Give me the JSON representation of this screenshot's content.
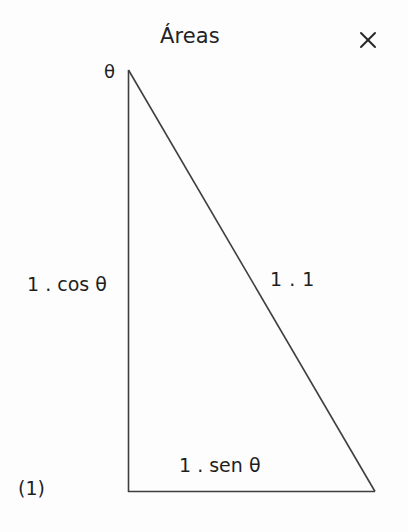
{
  "window": {
    "title": "Áreas",
    "close_icon": "close-x-icon",
    "close_label": "×"
  },
  "figure": {
    "index_label": "(1)",
    "vertex_angle_label": "θ",
    "adjacent_side_label": "1 . cos θ",
    "hypotenuse_label": "1 . 1",
    "opposite_side_label": "1 . sen θ",
    "line_color": "#3a3a3a",
    "background_color": "#fdfdfd",
    "text_color": "#1f1f1f",
    "geometry": {
      "apex": [
        128,
        70
      ],
      "right_angle_vertex": [
        128,
        492
      ],
      "far_vertex": [
        375,
        492
      ]
    }
  }
}
